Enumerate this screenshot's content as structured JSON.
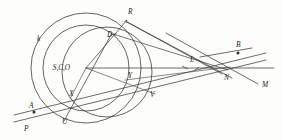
{
  "figure": {
    "kind": "geometry-diagram",
    "background_color": "#fdfdfc",
    "ink_color": "#3b3b3b",
    "labels": [
      {
        "id": "k",
        "text": "k",
        "x": 37,
        "y": 41,
        "class": "lbl"
      },
      {
        "id": "R",
        "text": "R",
        "x": 128,
        "y": 14,
        "class": "lbl"
      },
      {
        "id": "D",
        "text": "D",
        "x": 107,
        "y": 37,
        "class": "lbl"
      },
      {
        "id": "center",
        "text": "S,C,O",
        "x": 70,
        "y": 70,
        "class": "lbl-center"
      },
      {
        "id": "B",
        "text": "B",
        "x": 236,
        "y": 47,
        "class": "lbl"
      },
      {
        "id": "L",
        "text": "L",
        "x": 190,
        "y": 62,
        "class": "lbl"
      },
      {
        "id": "N",
        "text": "N",
        "x": 224,
        "y": 80,
        "class": "lbl"
      },
      {
        "id": "M",
        "text": "M",
        "x": 262,
        "y": 87,
        "class": "lbl"
      },
      {
        "id": "Y",
        "text": "Y",
        "x": 128,
        "y": 78,
        "class": "lbl"
      },
      {
        "id": "V",
        "text": "V",
        "x": 150,
        "y": 97,
        "class": "lbl"
      },
      {
        "id": "X",
        "text": "X",
        "x": 69,
        "y": 96,
        "class": "lbl"
      },
      {
        "id": "U",
        "text": "U",
        "x": 62,
        "y": 124,
        "class": "lbl"
      },
      {
        "id": "A",
        "text": "A",
        "x": 29,
        "y": 108,
        "class": "lbl"
      },
      {
        "id": "P",
        "text": "P",
        "x": 24,
        "y": 131,
        "class": "lbl"
      }
    ],
    "points": [
      {
        "id": "A-dot",
        "x": 34,
        "y": 112,
        "r": 1.5
      },
      {
        "id": "B-dot",
        "x": 238,
        "y": 53,
        "r": 1.5
      }
    ],
    "circles": [
      {
        "id": "outer-circle-k",
        "cx": 86,
        "cy": 68,
        "r": 55
      },
      {
        "id": "inner-circle",
        "cx": 86,
        "cy": 68,
        "r": 43
      },
      {
        "id": "third-circle",
        "cx": 107,
        "cy": 72,
        "r": 45
      }
    ]
  }
}
